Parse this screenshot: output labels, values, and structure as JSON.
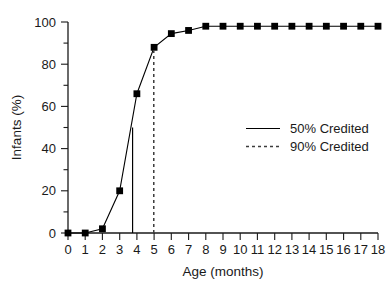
{
  "chart_data": {
    "type": "line",
    "title": "",
    "xlabel": "Age (months)",
    "ylabel": "Infants (%)",
    "xlim": [
      0,
      18
    ],
    "ylim": [
      0,
      100
    ],
    "grid": false,
    "legend_position": "center-right",
    "x": [
      0,
      1,
      2,
      3,
      4,
      5,
      6,
      7,
      8,
      9,
      10,
      11,
      12,
      13,
      14,
      15,
      16,
      17,
      18
    ],
    "categories": [
      "0",
      "1",
      "2",
      "3",
      "4",
      "5",
      "6",
      "7",
      "8",
      "9",
      "10",
      "11",
      "12",
      "13",
      "14",
      "15",
      "16",
      "17",
      "18"
    ],
    "series": [
      {
        "name": "Cumulative infants credited",
        "marker": "filled-square",
        "linestyle": "solid",
        "values": [
          0,
          0,
          2,
          20,
          66,
          88,
          94.5,
          96,
          98,
          98,
          98,
          98,
          98,
          98,
          98,
          98,
          98,
          98,
          98
        ]
      }
    ],
    "xticks": [
      0,
      1,
      2,
      3,
      4,
      5,
      6,
      7,
      8,
      9,
      10,
      11,
      12,
      13,
      14,
      15,
      16,
      17,
      18
    ],
    "xtick_labels": [
      "0",
      "1",
      "2",
      "3",
      "4",
      "5",
      "6",
      "7",
      "8",
      "9",
      "10",
      "11",
      "12",
      "13",
      "14",
      "15",
      "16",
      "17",
      "18"
    ],
    "yticks_major": [
      0,
      20,
      40,
      60,
      80,
      100
    ],
    "ytick_labels": [
      "0",
      "20",
      "40",
      "60",
      "80",
      "100"
    ],
    "yticks_minor": [
      10,
      30,
      50,
      70,
      90
    ],
    "annotations": [
      {
        "name": "50-percent-reference-line",
        "label": "50% Credited",
        "linestyle": "solid",
        "x": 3.75,
        "y_from": 0,
        "y_to": 50
      },
      {
        "name": "90-percent-reference-line",
        "label": "90% Credited",
        "linestyle": "dashed",
        "x": 4.98,
        "y_from": 0,
        "y_to": 88
      }
    ],
    "legend": [
      {
        "label": "50% Credited",
        "linestyle": "solid",
        "color": "#000000"
      },
      {
        "label": "90% Credited",
        "linestyle": "dashed",
        "color": "#3c3c3c"
      }
    ],
    "colors": {
      "line": "#000000",
      "marker": "#000000",
      "axis": "#1a1a1a",
      "dashed_reference": "#3c3c3c",
      "background": "#ffffff"
    }
  }
}
